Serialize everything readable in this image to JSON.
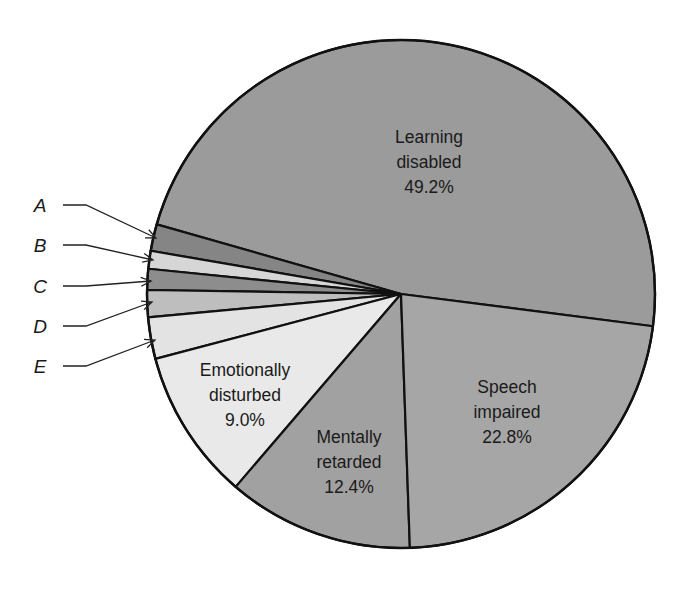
{
  "chart_data": {
    "type": "pie",
    "title": "",
    "slices": [
      {
        "key": "learning",
        "label": "Learning disabled",
        "value": 49.2,
        "display": "49.2%",
        "lines": [
          "Learning",
          "disabled",
          "49.2%"
        ],
        "color": "#9b9b9b",
        "start_deg": -7.3,
        "end_deg": 164.1
      },
      {
        "key": "A",
        "label": "A",
        "value": null,
        "display": "",
        "lines": [],
        "color": "#858585",
        "start_deg": 164.1,
        "end_deg": 170.2
      },
      {
        "key": "B",
        "label": "B",
        "value": null,
        "display": "",
        "lines": [],
        "color": "#d6d6d6",
        "start_deg": 170.2,
        "end_deg": 174.3
      },
      {
        "key": "C",
        "label": "C",
        "value": null,
        "display": "",
        "lines": [],
        "color": "#8d8d8d",
        "start_deg": 174.3,
        "end_deg": 179.1
      },
      {
        "key": "D",
        "label": "D",
        "value": null,
        "display": "",
        "lines": [],
        "color": "#bebebe",
        "start_deg": 179.1,
        "end_deg": 185.3
      },
      {
        "key": "E",
        "label": "E",
        "value": null,
        "display": "",
        "lines": [],
        "color": "#e3e3e3",
        "start_deg": 185.3,
        "end_deg": 194.8
      },
      {
        "key": "emotional",
        "label": "Emotionally disturbed",
        "value": 9.0,
        "display": "9.0%",
        "lines": [
          "Emotionally",
          "disturbed",
          "9.0%"
        ],
        "color": "#e9e9e9",
        "start_deg": 194.8,
        "end_deg": 229.4
      },
      {
        "key": "mental",
        "label": "Mentally retarded",
        "value": 12.4,
        "display": "12.4%",
        "lines": [
          "Mentally",
          "retarded",
          "12.4%"
        ],
        "color": "#a1a1a1",
        "start_deg": 229.4,
        "end_deg": 272.0
      },
      {
        "key": "speech",
        "label": "Speech impaired",
        "value": 22.8,
        "display": "22.8%",
        "lines": [
          "Speech",
          "impaired",
          "22.8%"
        ],
        "color": "#a6a6a6",
        "start_deg": 272.0,
        "end_deg": 352.7
      }
    ],
    "categories": [
      "Learning disabled",
      "A",
      "B",
      "C",
      "D",
      "E",
      "Emotionally disturbed",
      "Mentally retarded",
      "Speech impaired"
    ],
    "values": [
      49.2,
      null,
      null,
      null,
      null,
      null,
      9.0,
      12.4,
      22.8
    ],
    "callout_letters": [
      "A",
      "B",
      "C",
      "D",
      "E"
    ],
    "legend_position": "left (lettered callouts with arrows)"
  },
  "labels": {
    "learning": {
      "line1": "Learning",
      "line2": "disabled",
      "line3": "49.2%"
    },
    "speech": {
      "line1": "Speech",
      "line2": "impaired",
      "line3": "22.8%"
    },
    "mental": {
      "line1": "Mentally",
      "line2": "retarded",
      "line3": "12.4%"
    },
    "emotional": {
      "line1": "Emotionally",
      "line2": "disturbed",
      "line3": "9.0%"
    }
  },
  "callouts": [
    {
      "letter": "A",
      "text_x": 40,
      "text_y": 212,
      "line_y": 205,
      "tip_x": 156,
      "tip_y": 238
    },
    {
      "letter": "B",
      "text_x": 40,
      "text_y": 252,
      "line_y": 245,
      "tip_x": 153,
      "tip_y": 260
    },
    {
      "letter": "C",
      "text_x": 40,
      "text_y": 293,
      "line_y": 286,
      "tip_x": 151,
      "tip_y": 281
    },
    {
      "letter": "D",
      "text_x": 40,
      "text_y": 333,
      "line_y": 326,
      "tip_x": 152,
      "tip_y": 302
    },
    {
      "letter": "E",
      "text_x": 40,
      "text_y": 373,
      "line_y": 366,
      "tip_x": 155,
      "tip_y": 340
    }
  ],
  "geometry": {
    "cx": 401,
    "cy": 294,
    "r": 254
  }
}
